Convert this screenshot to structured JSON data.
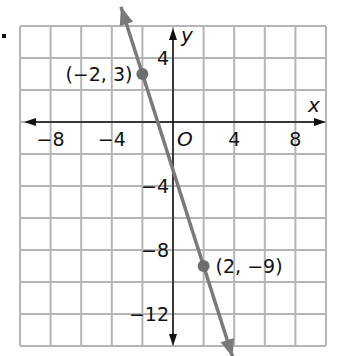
{
  "chart_data": {
    "type": "line",
    "title": "",
    "xlabel": "x",
    "ylabel": "y",
    "origin_label": "O",
    "xlim": [
      -10,
      10
    ],
    "ylim": [
      -14,
      6
    ],
    "grid": true,
    "grid_step": 2,
    "x_ticks": [
      {
        "value": -8,
        "label": "−8"
      },
      {
        "value": -4,
        "label": "−4"
      },
      {
        "value": 4,
        "label": "4"
      },
      {
        "value": 8,
        "label": "8"
      }
    ],
    "y_ticks": [
      {
        "value": 4,
        "label": "4"
      },
      {
        "value": -4,
        "label": "−4"
      },
      {
        "value": -8,
        "label": "−8"
      },
      {
        "value": -12,
        "label": "−12"
      }
    ],
    "series": [
      {
        "name": "line through (-2, 3) and (2, -9)",
        "equation": "y = -3x - 3",
        "slope": -3,
        "intercept": -3,
        "points": [
          {
            "x": -2,
            "y": 3,
            "label": "(−2, 3)"
          },
          {
            "x": 2,
            "y": -9,
            "label": "(2, −9)"
          }
        ],
        "color": "#7a7a7a"
      }
    ]
  },
  "colors": {
    "grid": "#b5b5b5",
    "axes": "#111111",
    "line": "#7a7a7a",
    "points": "#6e6e6e"
  }
}
